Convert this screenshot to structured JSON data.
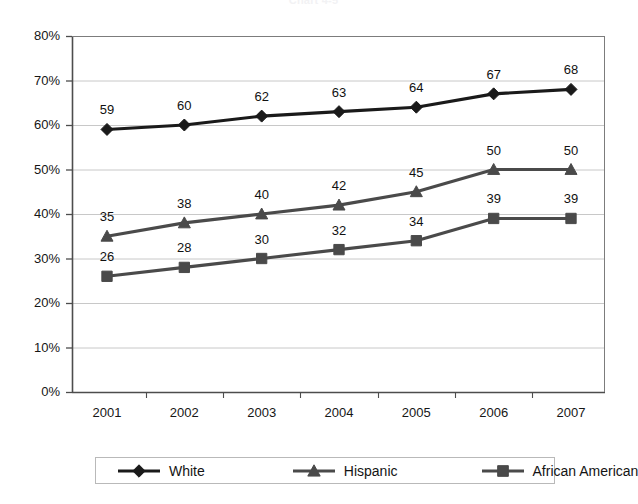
{
  "chart_data": {
    "type": "line",
    "title": "Chart 4-5",
    "caption": "",
    "xlabel": "",
    "ylabel": "",
    "categories": [
      "2001",
      "2002",
      "2003",
      "2004",
      "2005",
      "2006",
      "2007"
    ],
    "ylim": [
      0,
      80
    ],
    "ytick_step": 10,
    "ytick_labels": [
      "0%",
      "10%",
      "20%",
      "30%",
      "40%",
      "50%",
      "60%",
      "70%",
      "80%"
    ],
    "ytick_values": [
      0,
      10,
      20,
      30,
      40,
      50,
      60,
      70,
      80
    ],
    "grid": "horizontal",
    "legend_position": "bottom",
    "data_labels": true,
    "series": [
      {
        "name": "White",
        "marker": "diamond",
        "color": "#1a1a1a",
        "values": [
          59,
          60,
          62,
          63,
          64,
          67,
          68
        ],
        "labels": [
          "59",
          "60",
          "62",
          "63",
          "64",
          "67",
          "68"
        ]
      },
      {
        "name": "Hispanic",
        "marker": "triangle",
        "color": "#4a4a4a",
        "values": [
          35,
          38,
          40,
          42,
          45,
          50,
          50
        ],
        "labels": [
          "35",
          "38",
          "40",
          "42",
          "45",
          "50",
          "50"
        ]
      },
      {
        "name": "African American",
        "marker": "square",
        "color": "#4a4a4a",
        "values": [
          26,
          28,
          30,
          32,
          34,
          39,
          39
        ],
        "labels": [
          "26",
          "28",
          "30",
          "32",
          "34",
          "39",
          "39"
        ]
      }
    ]
  },
  "colors": {
    "plot_border": "#7c7c7c",
    "gridline": "#c8c8c8",
    "axis": "#6e6e6e",
    "text": "#161616",
    "background": "#ffffff"
  }
}
